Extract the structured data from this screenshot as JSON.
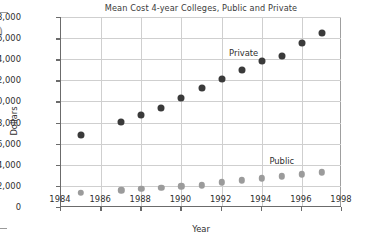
{
  "chart_data": {
    "type": "scatter",
    "title": "Mean Cost 4-year Colleges, Public and Private",
    "xlabel": "Year",
    "ylabel": "Dollars",
    "xlim": [
      1984,
      1998
    ],
    "ylim": [
      0,
      18000
    ],
    "xticks": [
      "1984",
      "1986",
      "1988",
      "1990",
      "1992",
      "1994",
      "1996",
      "1998"
    ],
    "xtick_values": [
      1984,
      1986,
      1988,
      1990,
      1992,
      1994,
      1996,
      1998
    ],
    "yticks": [
      "0",
      "2,000",
      "4,000",
      "6,000",
      "8,000",
      "10,000",
      "12,000",
      "14,000",
      "16,000",
      "18,000"
    ],
    "ytick_values": [
      0,
      2000,
      4000,
      6000,
      8000,
      10000,
      12000,
      14000,
      16000,
      18000
    ],
    "grid": "both",
    "legend_position": "inline-annotation",
    "series": [
      {
        "name": "Private",
        "color": "#3a3a3a",
        "marker": "filled-circle",
        "x": [
          1985,
          1987,
          1988,
          1989,
          1990,
          1991,
          1992,
          1993,
          1994,
          1995,
          1996,
          1997
        ],
        "values": [
          6800,
          8100,
          8700,
          9400,
          10300,
          11300,
          12100,
          13000,
          13850,
          14300,
          15550,
          16450
        ]
      },
      {
        "name": "Public",
        "color": "#9b9b9b",
        "marker": "filled-circle",
        "x": [
          1985,
          1987,
          1988,
          1989,
          1990,
          1991,
          1992,
          1993,
          1994,
          1995,
          1996,
          1997
        ],
        "values": [
          1350,
          1600,
          1700,
          1800,
          1970,
          2060,
          2340,
          2520,
          2720,
          2900,
          3100,
          3280
        ]
      }
    ],
    "annotations": [
      {
        "text": "Private",
        "x": 1993.1,
        "y": 14600
      },
      {
        "text": "Public",
        "x": 1995.0,
        "y": 4350
      }
    ]
  },
  "page": {
    "edge_glyph": ")"
  }
}
